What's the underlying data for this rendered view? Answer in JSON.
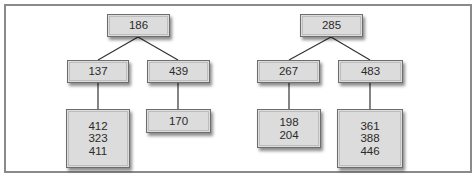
{
  "diagram": {
    "type": "tree-pair",
    "colors": {
      "frame_border": "#8a8a8a",
      "node_fill": "#dcdcdc",
      "node_border": "#6d6d6d",
      "edge": "#333333",
      "text": "#2a2a2a"
    },
    "trees": [
      {
        "root": {
          "values": [
            "186"
          ]
        },
        "children": [
          {
            "values": [
              "137"
            ],
            "child": {
              "values": [
                "412",
                "323",
                "411"
              ]
            }
          },
          {
            "values": [
              "439"
            ],
            "child": {
              "values": [
                "170"
              ]
            }
          }
        ]
      },
      {
        "root": {
          "values": [
            "285"
          ]
        },
        "children": [
          {
            "values": [
              "267"
            ],
            "child": {
              "values": [
                "198",
                "204"
              ]
            }
          },
          {
            "values": [
              "483"
            ],
            "child": {
              "values": [
                "361",
                "388",
                "446"
              ]
            }
          }
        ]
      }
    ]
  }
}
